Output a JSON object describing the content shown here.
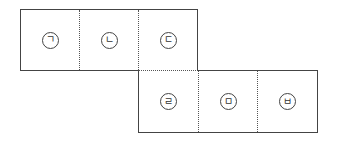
{
  "diagram": {
    "type": "cube-net",
    "top_row": [
      {
        "label": "ㄱ"
      },
      {
        "label": "ㄴ"
      },
      {
        "label": "ㄷ"
      }
    ],
    "bottom_row": [
      {
        "label": "ㄹ"
      },
      {
        "label": "ㅁ"
      },
      {
        "label": "ㅂ"
      }
    ],
    "colors": {
      "line": "#444444",
      "background": "#ffffff"
    }
  }
}
